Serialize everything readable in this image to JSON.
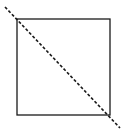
{
  "diagram": {
    "colors": {
      "background": "#ffffff",
      "stroke": "#1a1a1a"
    },
    "square": {
      "x": 17,
      "y": 19,
      "width": 93,
      "height": 96,
      "stroke_width": 1.3
    },
    "diagonal": {
      "x1": 5,
      "y1": 7,
      "x2": 120,
      "y2": 128,
      "dash": "3,2",
      "stroke_width": 1.6
    }
  }
}
